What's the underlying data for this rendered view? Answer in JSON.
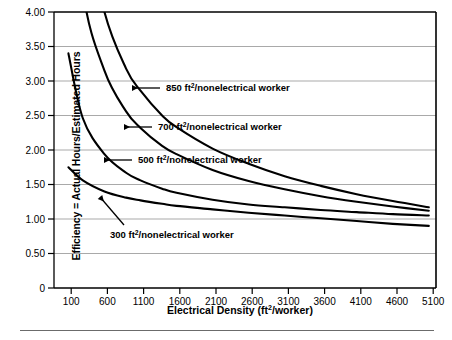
{
  "figure": {
    "background": "#ffffff",
    "axis_color": "#000000",
    "grid_color": "#a9a9a9",
    "curve_color": "#000000",
    "bottom_rule": "horizontal-rule"
  },
  "chart_data": {
    "type": "line",
    "title": "",
    "xlabel": "Electrical Density (ft2/worker)",
    "xlabel_parts": {
      "pre": "Electrical Density (ft",
      "sup": "2",
      "post": "/worker)"
    },
    "ylabel": "Efficiency = Actual Hours/Estimated Hours",
    "xlim": [
      -100,
      5200
    ],
    "ylim": [
      0,
      4.0
    ],
    "grid": true,
    "grid_axis": "y",
    "legend_position": "inline-annotations",
    "xticks": [
      100,
      600,
      1100,
      1600,
      2100,
      2600,
      3100,
      3600,
      4100,
      4600,
      5100
    ],
    "xticklabels": [
      "100",
      "600",
      "1100",
      "1600",
      "2100",
      "2600",
      "3100",
      "3600",
      "4100",
      "4600",
      "5100"
    ],
    "yticks": [
      0,
      0.5,
      1.0,
      1.5,
      2.0,
      2.5,
      3.0,
      3.5,
      4.0
    ],
    "yticklabels": [
      "0",
      "0.50",
      "1.00",
      "1.50",
      "2.00",
      "2.50",
      "3.00",
      "3.50",
      "4.00"
    ],
    "x": [
      100,
      300,
      600,
      900,
      1100,
      1400,
      1600,
      2100,
      2600,
      3100,
      3600,
      4100,
      4600,
      5100
    ],
    "series": [
      {
        "name": "850 ft2/nonelectrical worker",
        "label_pre": "850 ft",
        "label_sup": "2",
        "label_post": "/nonelectrical worker",
        "values": [
          9.2,
          5.55,
          4.0,
          3.18,
          2.86,
          2.5,
          2.33,
          2.02,
          1.8,
          1.62,
          1.48,
          1.36,
          1.26,
          1.17
        ],
        "annotation_x": 1400,
        "annotation_y": 2.5
      },
      {
        "name": "700 ft2/nonelectrical worker",
        "label_pre": "700 ft",
        "label_sup": "2",
        "label_post": "/nonelectrical worker",
        "values": [
          6.9,
          4.32,
          3.15,
          2.56,
          2.32,
          2.06,
          1.94,
          1.71,
          1.55,
          1.43,
          1.33,
          1.25,
          1.18,
          1.12
        ],
        "annotation_x": 1100,
        "annotation_y": 2.1
      },
      {
        "name": "500 ft2/nonelectrical worker",
        "label_pre": "500 ft",
        "label_sup": "2",
        "label_post": "/nonelectrical worker",
        "values": [
          3.4,
          2.46,
          1.94,
          1.67,
          1.56,
          1.44,
          1.38,
          1.28,
          1.21,
          1.17,
          1.13,
          1.1,
          1.07,
          1.05
        ],
        "annotation_x": 760,
        "annotation_y": 1.77
      },
      {
        "name": "300 ft2/nonelectrical worker",
        "label_pre": "300 ft",
        "label_sup": "2",
        "label_post": "/nonelectrical worker",
        "values": [
          1.75,
          1.56,
          1.4,
          1.31,
          1.27,
          1.22,
          1.19,
          1.14,
          1.09,
          1.05,
          1.01,
          0.97,
          0.93,
          0.9
        ],
        "annotation_x": 900,
        "annotation_y": 1.22
      }
    ],
    "annotations": [
      {
        "text": "850 ft2/nonelectrical worker",
        "arrow": "left-arrow"
      },
      {
        "text": "700 ft2/nonelectrical worker",
        "arrow": "left-arrow"
      },
      {
        "text": "500 ft2/nonelectrical worker",
        "arrow": "left-arrow"
      },
      {
        "text": "300 ft2/nonelectrical worker",
        "arrow": "diagonal-arrow-up-left"
      }
    ]
  }
}
